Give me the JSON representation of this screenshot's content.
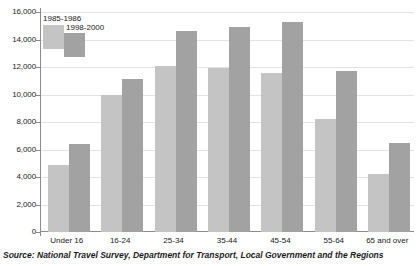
{
  "chart_data": {
    "type": "bar",
    "title": "",
    "xlabel": "",
    "ylabel": "",
    "ylim": [
      0,
      16000
    ],
    "ytick_step": 2000,
    "grid": true,
    "legend_position": "top-left",
    "categories": [
      "Under 16",
      "16-24",
      "25-34",
      "35-44",
      "45-54",
      "55-64",
      "65 and over"
    ],
    "ytick_labels": [
      "16,000",
      "14,000",
      "12,000",
      "10,000",
      "8,000",
      "6,000",
      "4,000",
      "2,000",
      "0"
    ],
    "ytick_values": [
      16000,
      14000,
      12000,
      10000,
      8000,
      6000,
      4000,
      2000,
      0
    ],
    "series": [
      {
        "name": "1985-1986",
        "color": "#c4c4c4",
        "values": [
          4900,
          10000,
          12050,
          11950,
          11550,
          8200,
          4200
        ]
      },
      {
        "name": "1998-2000",
        "color": "#a2a2a2",
        "values": [
          6400,
          11100,
          14600,
          14900,
          15300,
          11700,
          6500
        ]
      }
    ],
    "source_note": "Source: National Travel Survey, Department for Transport, Local Government and the Regions"
  }
}
